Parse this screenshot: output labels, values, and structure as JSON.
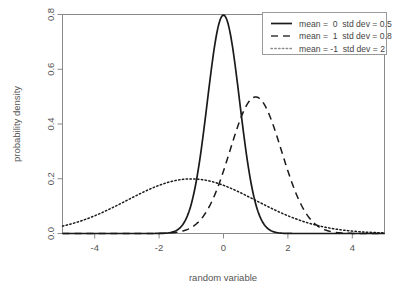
{
  "chart_data": {
    "type": "line",
    "title": "",
    "xlabel": "random variable",
    "ylabel": "probability density",
    "xlim": [
      -5,
      5
    ],
    "ylim": [
      0,
      0.8
    ],
    "xticks": [
      "-4",
      "-2",
      "0",
      "2",
      "4"
    ],
    "xtick_values": [
      -4,
      -2,
      0,
      2,
      4
    ],
    "yticks": [
      "0.0",
      "0.2",
      "0.4",
      "0.6",
      "0.8"
    ],
    "ytick_values": [
      0.0,
      0.2,
      0.4,
      0.6,
      0.8
    ],
    "grid": false,
    "legend_position": "top-right",
    "series": [
      {
        "name": "mean =  0  std dev = 0.5",
        "mean": 0,
        "std_dev": 0.5,
        "linestyle": "solid",
        "color": "#1a1a1a",
        "peak_value": 0.798,
        "peak_x": 0,
        "x": [
          -5,
          -4.5,
          -4,
          -3.5,
          -3,
          -2.5,
          -2.25,
          -2,
          -1.75,
          -1.5,
          -1.25,
          -1,
          -0.875,
          -0.75,
          -0.625,
          -0.5,
          -0.375,
          -0.25,
          -0.125,
          0,
          0.125,
          0.25,
          0.375,
          0.5,
          0.625,
          0.75,
          0.875,
          1,
          1.25,
          1.5,
          1.75,
          2,
          2.25,
          2.5,
          3,
          3.5,
          4,
          4.5,
          5
        ],
        "y": [
          0.0,
          0.0,
          0.0,
          0.0,
          0.0,
          0.0001,
          0.0005,
          0.0027,
          0.0122,
          0.0443,
          0.1295,
          0.3079,
          0.4578,
          0.6334,
          0.7365,
          0.7979,
          0.7365,
          0.7041,
          0.7864,
          0.7979,
          0.7864,
          0.7041,
          0.7365,
          0.4839,
          0.3247,
          0.1826,
          0.0863,
          0.054,
          0.0111,
          0.0018,
          0.0002,
          0.0,
          0.0,
          0.0,
          0.0,
          0.0,
          0.0,
          0.0,
          0.0
        ]
      },
      {
        "name": "mean =  1  std dev = 0.8",
        "mean": 1,
        "std_dev": 0.8,
        "linestyle": "dashed",
        "color": "#3a3a3a",
        "peak_value": 0.499,
        "peak_x": 1,
        "x": [
          -5,
          -4,
          -3,
          -2.5,
          -2,
          -1.5,
          -1,
          -0.5,
          0,
          0.25,
          0.5,
          0.75,
          1,
          1.25,
          1.5,
          1.75,
          2,
          2.5,
          3,
          3.5,
          4,
          4.5,
          5
        ],
        "y": [
          0.0,
          0.0,
          0.0,
          0.0,
          0.0003,
          0.0022,
          0.0116,
          0.0438,
          0.1191,
          0.1822,
          0.2497,
          0.3178,
          0.4986,
          0.456,
          0.3178,
          0.2497,
          0.1822,
          0.0438,
          0.0116,
          0.0022,
          0.0003,
          0.0,
          0.0
        ]
      },
      {
        "name": "mean = -1  std dev = 2",
        "mean": -1,
        "std_dev": 2,
        "linestyle": "dotted",
        "color": "#8c8c8c",
        "peak_value": 0.199,
        "peak_x": -1,
        "x": [
          -5,
          -4.5,
          -4,
          -3.5,
          -3,
          -2.5,
          -2,
          -1.5,
          -1,
          -0.5,
          0,
          0.5,
          1,
          1.5,
          2,
          2.5,
          3,
          3.5,
          4,
          4.5,
          5
        ],
        "y": [
          0.027,
          0.041,
          0.0648,
          0.0913,
          0.121,
          0.1505,
          0.176,
          0.1933,
          0.1995,
          0.1933,
          0.176,
          0.1505,
          0.121,
          0.0913,
          0.0648,
          0.0432,
          0.027,
          0.0158,
          0.0088,
          0.0046,
          0.0022
        ]
      }
    ]
  },
  "legend": {
    "entries": [
      {
        "label": "mean =  0  std dev = 0.5",
        "style": "solid"
      },
      {
        "label": "mean =  1  std dev = 0.8",
        "style": "dashed"
      },
      {
        "label": "mean = -1  std dev = 2",
        "style": "dotted"
      }
    ]
  }
}
